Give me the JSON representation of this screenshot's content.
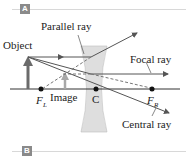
{
  "panels": {
    "top": {
      "tag": "A"
    },
    "bottom": {
      "tag": "B"
    }
  },
  "labels": {
    "object": "Object",
    "parallel_ray": "Parallel ray",
    "focal_ray": "Focal ray",
    "central_ray": "Central ray",
    "image": "Image",
    "center": "C",
    "focal_left": "F",
    "focal_left_sub": "L",
    "focal_right": "F",
    "focal_right_sub": "R"
  },
  "colors": {
    "ray": "#555555",
    "lens": "#d9d9d9",
    "object_arrow": "#666666",
    "image_arrow": "#a8a8a8",
    "axis": "#333333",
    "tag_bg": "#8a8a8a"
  }
}
